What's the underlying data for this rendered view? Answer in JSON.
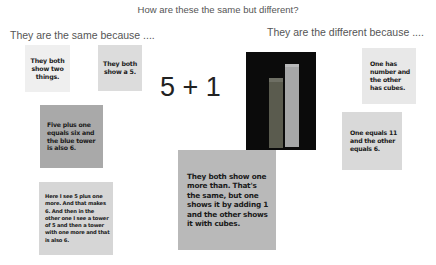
{
  "title": "How are these the same but different?",
  "same_heading": "They are the same because ....",
  "different_heading": "They are the different because ....",
  "equation": "5 + 1",
  "photo": {
    "description": "tower-of-cubes-photo",
    "background": "#0b0b0b",
    "short_tower_color": "#5a5b4e",
    "tall_tower_color": "#a6a7a8"
  },
  "same_cards": [
    {
      "text": "They both show two things.",
      "bg": "#efefef"
    },
    {
      "text": "They both show a 5.",
      "bg": "#dcdcdc"
    },
    {
      "text": "Five plus one equals six and the blue tower is also 6.",
      "bg": "#a9a9a9"
    },
    {
      "text": "Here I see 5 plus one more. And that makes 6. And then in the other one I see a tower of 5 and then a tower with one more and that is also 6.",
      "bg": "#d6d6d6"
    }
  ],
  "different_cards": [
    {
      "text": "One has number and the other has cubes.",
      "bg": "#e8e8e8"
    },
    {
      "text": "One equals 11 and the other equals 6.",
      "bg": "#d9d9d9"
    }
  ],
  "center_card": {
    "text": "They both show one more than. That's the same, but one shows it by adding 1 and the other shows it with cubes.",
    "bg": "#b9b9b9"
  }
}
